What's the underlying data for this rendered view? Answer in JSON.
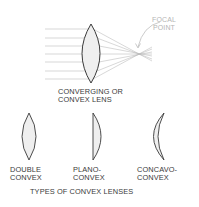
{
  "diagram": {
    "main_lens": {
      "label_line1": "CONVERGING OR",
      "label_line2": "CONVEX LENS"
    },
    "focal_point": {
      "label_line1": "FOCAL",
      "label_line2": "POINT"
    },
    "lens_types": [
      {
        "id": "double-convex",
        "line1": "DOUBLE",
        "line2": "CONVEX"
      },
      {
        "id": "plano-convex",
        "line1": "PLANO-",
        "line2": "CONVEX"
      },
      {
        "id": "concavo-convex",
        "line1": "CONCAVO-",
        "line2": "CONVEX"
      }
    ],
    "section_title": "TYPES OF CONVEX LENSES",
    "colors": {
      "lens_stroke": "#3a3a3a",
      "lens_fill": "#efefef",
      "ray": "#b8b8b8",
      "focal_label": "#b5b5b5"
    }
  }
}
